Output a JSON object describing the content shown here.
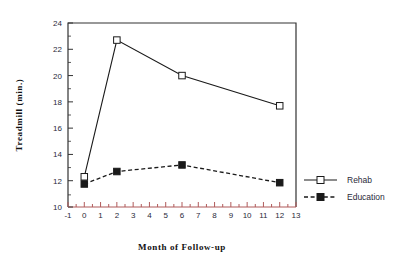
{
  "chart_data": {
    "type": "line",
    "title": "",
    "xlabel": "Month of Follow-up",
    "ylabel": "Treadmill  (min.)",
    "x": [
      0,
      2,
      6,
      12
    ],
    "xlim": [
      -1,
      13
    ],
    "ylim": [
      10,
      24
    ],
    "xticks": [
      "-1",
      "0",
      "1",
      "2",
      "3",
      "4",
      "5",
      "6",
      "7",
      "8",
      "9",
      "10",
      "11",
      "12",
      "13"
    ],
    "yticks": [
      "10",
      "12",
      "14",
      "16",
      "18",
      "20",
      "22",
      "24"
    ],
    "grid": false,
    "legend_position": "right",
    "series": [
      {
        "name": "Rehab",
        "values": [
          12.3,
          22.7,
          20.0,
          17.7
        ],
        "line_style": "solid",
        "marker": "open-square",
        "color": "#1a1a1a"
      },
      {
        "name": "Education",
        "values": [
          11.75,
          12.7,
          13.2,
          11.85
        ],
        "line_style": "dashed",
        "marker": "filled-square",
        "color": "#1a1a1a"
      }
    ]
  },
  "axes": {
    "y_title": "Treadmill  (min.)",
    "x_title": "Month of Follow-up"
  },
  "legend": {
    "items": [
      {
        "label": "Rehab"
      },
      {
        "label": "Education"
      }
    ]
  },
  "ytick_labels": {
    "t0": "10",
    "t1": "12",
    "t2": "14",
    "t3": "16",
    "t4": "18",
    "t5": "20",
    "t6": "22",
    "t7": "24"
  },
  "xtick_labels": {
    "t0": "-1",
    "t1": "0",
    "t2": "1",
    "t3": "2",
    "t4": "3",
    "t5": "4",
    "t6": "5",
    "t7": "6",
    "t8": "7",
    "t9": "8",
    "t10": "9",
    "t11": "10",
    "t12": "11",
    "t13": "12",
    "t14": "13"
  }
}
